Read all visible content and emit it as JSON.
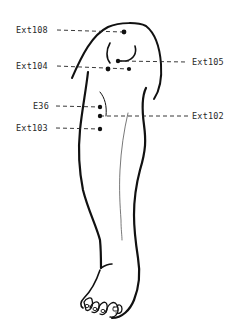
{
  "figure": {
    "ink_color": "#111111",
    "background": "#ffffff"
  },
  "points": [
    {
      "id": "ext108",
      "label": "Ext108",
      "side": "left",
      "dot": [
        124,
        32
      ],
      "label_pos": [
        16,
        25
      ]
    },
    {
      "id": "ext104",
      "label": "Ext104",
      "side": "left",
      "dot": [
        108,
        69
      ],
      "label_pos": [
        16,
        62
      ]
    },
    {
      "id": "ext105",
      "label": "Ext105",
      "side": "right",
      "dot": [
        118,
        61
      ],
      "label_pos": [
        192,
        58
      ]
    },
    {
      "id": "ext104b",
      "label": "",
      "side": "none",
      "dot": [
        129,
        69
      ],
      "label_pos": null
    },
    {
      "id": "e36",
      "label": "E36",
      "side": "left",
      "dot": [
        100,
        107
      ],
      "label_pos": [
        33,
        100
      ]
    },
    {
      "id": "ext102",
      "label": "Ext102",
      "side": "right",
      "dot": [
        100,
        116
      ],
      "label_pos": [
        192,
        111
      ]
    },
    {
      "id": "ext103",
      "label": "Ext103",
      "side": "left",
      "dot": [
        100,
        129
      ],
      "label_pos": [
        16,
        123
      ]
    }
  ]
}
